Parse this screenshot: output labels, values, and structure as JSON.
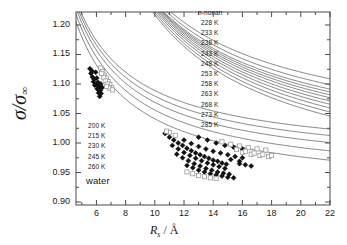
{
  "chart_data": {
    "type": "line",
    "title": "",
    "xlabel": "R_s / Å",
    "ylabel": "σ/σ∞",
    "xlim": [
      4.6,
      22.0
    ],
    "ylim": [
      0.895,
      1.222
    ],
    "xticks": [
      6,
      8,
      10,
      12,
      14,
      16,
      18,
      20,
      22
    ],
    "yticks": [
      "0.90",
      "0.95",
      "1.00",
      "1.05",
      "1.10",
      "1.15",
      "1.20"
    ],
    "minor_ticks": true,
    "grid": false,
    "legend_position": "inside-top-right / inside-left",
    "line_color": "#4a4a4a",
    "marker_filled_color": "#111111",
    "marker_open_color": "#9a9a9a",
    "series": [
      {
        "name": "water 200 K",
        "group": "water",
        "temperature_K": 200,
        "r_inf": 0.9155,
        "a": 1.3
      },
      {
        "name": "water 215 K",
        "group": "water",
        "temperature_K": 215,
        "r_inf": 0.932,
        "a": 1.26
      },
      {
        "name": "water 230 K",
        "group": "water",
        "temperature_K": 230,
        "r_inf": 0.947,
        "a": 1.22
      },
      {
        "name": "water 245 K",
        "group": "water",
        "temperature_K": 245,
        "r_inf": 0.96,
        "a": 1.18
      },
      {
        "name": "water 260 K",
        "group": "water",
        "temperature_K": 260,
        "r_inf": 0.972,
        "a": 1.14
      },
      {
        "name": "n-nonan 228 K",
        "group": "n-nonan",
        "temperature_K": 228,
        "r_inf": 0.91,
        "a": 3.2
      },
      {
        "name": "n-nonan 233 K",
        "group": "n-nonan",
        "temperature_K": 233,
        "r_inf": 0.919,
        "a": 3.12
      },
      {
        "name": "n-nonan 238 K",
        "group": "n-nonan",
        "temperature_K": 238,
        "r_inf": 0.928,
        "a": 3.04
      },
      {
        "name": "n-nonan 243 K",
        "group": "n-nonan",
        "temperature_K": 243,
        "r_inf": 0.9365,
        "a": 2.96
      },
      {
        "name": "n-nonan 248 K",
        "group": "n-nonan",
        "temperature_K": 248,
        "r_inf": 0.9445,
        "a": 2.88
      },
      {
        "name": "n-nonan 253 K",
        "group": "n-nonan",
        "temperature_K": 253,
        "r_inf": 0.9525,
        "a": 2.8
      },
      {
        "name": "n-nonan 258 K",
        "group": "n-nonan",
        "temperature_K": 258,
        "r_inf": 0.96,
        "a": 2.72
      },
      {
        "name": "n-nonan 263 K",
        "group": "n-nonan",
        "temperature_K": 263,
        "r_inf": 0.9675,
        "a": 2.64
      },
      {
        "name": "n-nonan 268 K",
        "group": "n-nonan",
        "temperature_K": 268,
        "r_inf": 0.975,
        "a": 2.56
      },
      {
        "name": "n-nonan 273 K",
        "group": "n-nonan",
        "temperature_K": 273,
        "r_inf": 0.985,
        "a": 2.48
      },
      {
        "name": "n-nonan 285 K",
        "group": "n-nonan",
        "temperature_K": 285,
        "r_inf": 0.999,
        "a": 2.36
      }
    ],
    "data_clusters": [
      {
        "group": "water",
        "marker": "filled-diamond",
        "points": [
          [
            5.55,
            1.126
          ],
          [
            5.62,
            1.118
          ],
          [
            5.72,
            1.112
          ],
          [
            5.8,
            1.104
          ],
          [
            5.88,
            1.098
          ],
          [
            5.95,
            1.12
          ],
          [
            6.02,
            1.11
          ],
          [
            6.1,
            1.103
          ],
          [
            6.18,
            1.096
          ],
          [
            6.26,
            1.089
          ],
          [
            6.05,
            1.092
          ],
          [
            6.14,
            1.085
          ],
          [
            6.22,
            1.079
          ],
          [
            6.3,
            1.1
          ],
          [
            6.4,
            1.094
          ],
          [
            5.7,
            1.122
          ],
          [
            5.84,
            1.108
          ],
          [
            6.0,
            1.099
          ],
          [
            6.12,
            1.091
          ],
          [
            6.32,
            1.084
          ]
        ]
      },
      {
        "group": "water",
        "marker": "open-square",
        "points": [
          [
            6.3,
            1.127
          ],
          [
            6.42,
            1.121
          ],
          [
            6.55,
            1.115
          ],
          [
            6.68,
            1.11
          ],
          [
            6.8,
            1.104
          ],
          [
            6.92,
            1.099
          ],
          [
            7.02,
            1.094
          ],
          [
            6.6,
            1.106
          ],
          [
            6.75,
            1.1
          ],
          [
            6.88,
            1.093
          ],
          [
            6.48,
            1.112
          ],
          [
            7.1,
            1.09
          ],
          [
            6.36,
            1.118
          ],
          [
            6.7,
            1.096
          ]
        ]
      },
      {
        "group": "n-nonan",
        "marker": "filled-diamond",
        "points": [
          [
            10.7,
            1.016
          ],
          [
            11.0,
            1.01
          ],
          [
            11.3,
            1.005
          ],
          [
            11.6,
            1.0
          ],
          [
            11.9,
            0.996
          ],
          [
            12.2,
            0.991
          ],
          [
            12.5,
            0.987
          ],
          [
            12.8,
            0.983
          ],
          [
            13.1,
            0.98
          ],
          [
            13.4,
            0.977
          ],
          [
            13.7,
            0.974
          ],
          [
            14.0,
            0.971
          ],
          [
            14.3,
            0.969
          ],
          [
            14.6,
            0.966
          ],
          [
            14.9,
            0.964
          ],
          [
            11.2,
            0.996
          ],
          [
            11.6,
            0.99
          ],
          [
            12.0,
            0.984
          ],
          [
            12.4,
            0.979
          ],
          [
            12.8,
            0.974
          ],
          [
            13.2,
            0.97
          ],
          [
            13.6,
            0.966
          ],
          [
            14.0,
            0.963
          ],
          [
            14.4,
            0.96
          ],
          [
            14.8,
            0.957
          ],
          [
            11.5,
            0.981
          ],
          [
            11.9,
            0.975
          ],
          [
            12.3,
            0.97
          ],
          [
            12.7,
            0.965
          ],
          [
            13.1,
            0.961
          ],
          [
            13.5,
            0.957
          ],
          [
            13.9,
            0.954
          ],
          [
            14.3,
            0.951
          ],
          [
            14.7,
            0.949
          ],
          [
            15.1,
            0.947
          ],
          [
            12.0,
            1.005
          ],
          [
            12.5,
            0.999
          ],
          [
            13.0,
            0.994
          ],
          [
            13.5,
            0.99
          ],
          [
            14.0,
            0.986
          ],
          [
            14.5,
            0.983
          ],
          [
            15.0,
            0.98
          ],
          [
            15.5,
            0.977
          ],
          [
            16.0,
            0.975
          ],
          [
            13.0,
            1.01
          ],
          [
            13.6,
            1.005
          ],
          [
            14.2,
            1.0
          ],
          [
            14.8,
            0.996
          ],
          [
            15.4,
            0.993
          ],
          [
            16.0,
            0.99
          ],
          [
            12.2,
            0.962
          ],
          [
            12.6,
            0.958
          ],
          [
            13.0,
            0.954
          ],
          [
            13.4,
            0.951
          ],
          [
            13.8,
            0.948
          ],
          [
            14.2,
            0.946
          ],
          [
            14.6,
            0.944
          ],
          [
            15.0,
            0.942
          ],
          [
            15.4,
            0.941
          ],
          [
            15.8,
            0.965
          ],
          [
            16.2,
            0.963
          ],
          [
            16.6,
            0.961
          ],
          [
            15.2,
            0.972
          ],
          [
            15.8,
            0.969
          ]
        ]
      },
      {
        "group": "n-nonan",
        "marker": "open-square",
        "points": [
          [
            15.2,
            0.998
          ],
          [
            15.8,
            0.995
          ],
          [
            16.4,
            0.992
          ],
          [
            17.0,
            0.99
          ],
          [
            17.6,
            0.988
          ],
          [
            16.0,
            0.984
          ],
          [
            16.6,
            0.981
          ],
          [
            17.2,
            0.979
          ],
          [
            17.8,
            0.977
          ],
          [
            15.6,
            0.989
          ],
          [
            16.2,
            0.986
          ],
          [
            16.8,
            0.983
          ],
          [
            17.4,
            0.981
          ],
          [
            18.0,
            0.979
          ],
          [
            14.6,
            1.002
          ],
          [
            11.0,
            1.018
          ],
          [
            11.4,
            1.013
          ],
          [
            10.8,
            1.02
          ],
          [
            12.6,
            0.948
          ],
          [
            13.0,
            0.945
          ],
          [
            13.4,
            0.943
          ],
          [
            13.8,
            0.941
          ],
          [
            12.2,
            0.951
          ],
          [
            14.2,
            0.94
          ]
        ]
      }
    ]
  },
  "legend_nonan": {
    "header": "n-nonan",
    "items": [
      "228 K",
      "233 K",
      "238 K",
      "243 K",
      "248 K",
      "253 K",
      "258 K",
      "263 K",
      "268 K",
      "273 K",
      "285 K"
    ]
  },
  "legend_water": {
    "items": [
      "200 K",
      "215 K",
      "230 K",
      "245 K",
      "260 K"
    ],
    "footer": "water"
  },
  "axis": {
    "y_label_main": "σ/σ",
    "y_label_sub": "∞",
    "x_label_main": "R",
    "x_label_sub": "s",
    "x_label_unit": " / Å"
  }
}
